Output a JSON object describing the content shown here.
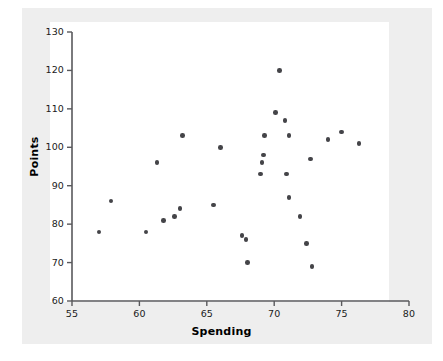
{
  "chart_data": {
    "type": "scatter",
    "title": "",
    "xlabel": "Spending",
    "ylabel": "Points",
    "xlim": [
      55,
      80
    ],
    "ylim": [
      60,
      130
    ],
    "xticks": [
      55,
      60,
      65,
      70,
      75,
      80
    ],
    "yticks": [
      60,
      70,
      80,
      90,
      100,
      110,
      120,
      130
    ],
    "grid": false,
    "legend": null,
    "marker_color": "#444448",
    "plot_background": "#ffffff",
    "panel_background": "#eeeeee",
    "points": [
      {
        "x": 57.0,
        "y": 78
      },
      {
        "x": 57.9,
        "y": 86
      },
      {
        "x": 60.5,
        "y": 78
      },
      {
        "x": 61.3,
        "y": 96
      },
      {
        "x": 61.8,
        "y": 81
      },
      {
        "x": 62.6,
        "y": 82
      },
      {
        "x": 63.0,
        "y": 84
      },
      {
        "x": 63.2,
        "y": 103
      },
      {
        "x": 65.5,
        "y": 85
      },
      {
        "x": 66.0,
        "y": 100
      },
      {
        "x": 67.6,
        "y": 77
      },
      {
        "x": 67.9,
        "y": 76
      },
      {
        "x": 68.0,
        "y": 70
      },
      {
        "x": 69.0,
        "y": 93
      },
      {
        "x": 69.1,
        "y": 96
      },
      {
        "x": 69.2,
        "y": 98
      },
      {
        "x": 69.3,
        "y": 103
      },
      {
        "x": 70.1,
        "y": 109
      },
      {
        "x": 70.4,
        "y": 120
      },
      {
        "x": 70.8,
        "y": 107
      },
      {
        "x": 70.9,
        "y": 93
      },
      {
        "x": 71.1,
        "y": 103
      },
      {
        "x": 71.1,
        "y": 87
      },
      {
        "x": 71.9,
        "y": 82
      },
      {
        "x": 72.4,
        "y": 75
      },
      {
        "x": 72.7,
        "y": 97
      },
      {
        "x": 72.8,
        "y": 69
      },
      {
        "x": 74.0,
        "y": 102
      },
      {
        "x": 75.0,
        "y": 104
      },
      {
        "x": 76.3,
        "y": 101
      }
    ]
  },
  "axis": {
    "x_tick_labels": [
      "55",
      "60",
      "65",
      "70",
      "75",
      "80"
    ],
    "y_tick_labels": [
      "60",
      "70",
      "80",
      "90",
      "100",
      "110",
      "120",
      "130"
    ],
    "x_title": "Spending",
    "y_title": "Points"
  }
}
